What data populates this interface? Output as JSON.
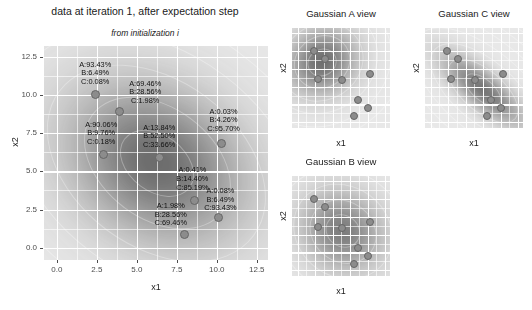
{
  "main": {
    "title": "data at iteration 1, after expectation step",
    "subtitle": "from initialization i",
    "xlabel": "x1",
    "ylabel": "x2",
    "xticks": [
      "0.0",
      "2.5",
      "5.0",
      "7.5",
      "10.0",
      "12.5"
    ],
    "yticks": [
      "0.0",
      "2.5",
      "5.0",
      "7.5",
      "10.0",
      "12.5"
    ]
  },
  "panels": [
    {
      "title": "Gaussian A view",
      "xlabel": "x1",
      "ylabel": "x2"
    },
    {
      "title": "Gaussian C view",
      "xlabel": "x1",
      "ylabel": "x2"
    },
    {
      "title": "Gaussian B view",
      "xlabel": "x1",
      "ylabel": "x2"
    }
  ],
  "chart_data": {
    "type": "scatter",
    "title": "data at iteration 1, after expectation step",
    "subtitle": "from initialization i",
    "xlabel": "x1",
    "ylabel": "x2",
    "xlim": [
      -0.8,
      13.2
    ],
    "ylim": [
      -0.8,
      13.2
    ],
    "xticks": [
      0.0,
      2.5,
      5.0,
      7.5,
      10.0,
      12.5
    ],
    "yticks": [
      0.0,
      2.5,
      5.0,
      7.5,
      10.0,
      12.5
    ],
    "grid": true,
    "legend": "none",
    "components": [
      "A",
      "B",
      "C"
    ],
    "points": [
      {
        "id": 1,
        "x": 2.4,
        "y": 10.0,
        "A": "93.43%",
        "B": "6.49%",
        "C": "0.08%",
        "label": [
          "A:93.43%",
          "B:6.49%",
          "C:0.08%"
        ]
      },
      {
        "id": 2,
        "x": 3.9,
        "y": 8.9,
        "A": "69.46%",
        "B": "28.56%",
        "C": "1.98%",
        "label": [
          "A:69.46%",
          "B:28.56%",
          "C:1.98%"
        ]
      },
      {
        "id": 3,
        "x": 2.9,
        "y": 6.1,
        "A": "90.06%",
        "B": "9.76%",
        "C": "0.18%",
        "label": [
          "A:90.06%",
          "B:9.76%",
          "C:0.18%"
        ]
      },
      {
        "id": 4,
        "x": 6.4,
        "y": 5.9,
        "A": "13.84%",
        "B": "52.50%",
        "C": "33.66%",
        "label": [
          "A:13.84%",
          "B:52.50%",
          "C:33.66%"
        ]
      },
      {
        "id": 5,
        "x": 10.3,
        "y": 6.8,
        "A": "0.03%",
        "B": "4.26%",
        "C": "95.70%",
        "label": [
          "A:0.03%",
          "B:4.26%",
          "C:95.70%"
        ]
      },
      {
        "id": 6,
        "x": 8.6,
        "y": 3.1,
        "A": "0.41%",
        "B": "14.40%",
        "C": "85.19%",
        "label": [
          "A:0.41%",
          "B:14.40%",
          "C:85.19%"
        ]
      },
      {
        "id": 7,
        "x": 10.1,
        "y": 2.0,
        "A": "0.08%",
        "B": "6.49%",
        "C": "93.43%",
        "label": [
          "A:0.08%",
          "B:6.49%",
          "C:93.43%"
        ]
      },
      {
        "id": 8,
        "x": 8.0,
        "y": 0.9,
        "A": "1.98%",
        "B": "28.56%",
        "C": "69.46%",
        "label": [
          "A:1.98%",
          "B:28.56%",
          "C:69.46%"
        ]
      }
    ],
    "facets": [
      {
        "name": "Gaussian A view",
        "component": "A",
        "density_center": [
          3.4,
          8.6
        ],
        "density_shape": "broad ellipse concentrated upper-left"
      },
      {
        "name": "Gaussian C view",
        "component": "C",
        "density_center": [
          7.4,
          4.6
        ],
        "density_shape": "diagonal band from upper-left to lower-right"
      },
      {
        "name": "Gaussian B view",
        "component": "B",
        "density_center": [
          6.3,
          5.6
        ],
        "density_shape": "broad centred blob"
      }
    ]
  },
  "colors": {
    "panel_background": "#e8e8e8",
    "gridline": "#ffffff",
    "point_fill": "#8c8c8c",
    "point_stroke": "#666666",
    "text": "#1a1a1a",
    "tick_text": "#4d4d4d"
  }
}
